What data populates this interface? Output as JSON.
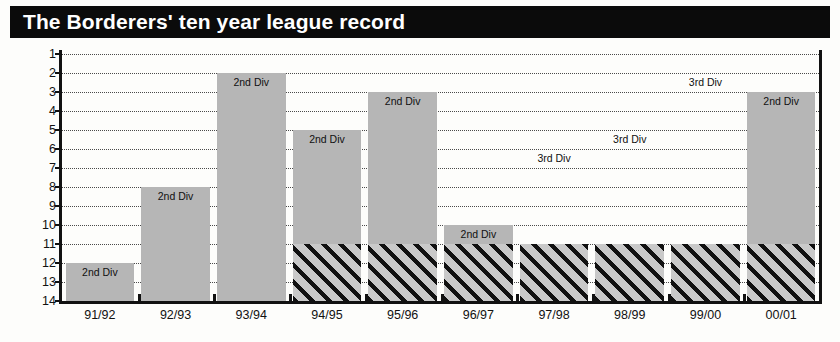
{
  "title": "The Borderers' ten year league record",
  "chart_data": {
    "type": "bar",
    "title": "The Borderers' ten year league record",
    "xlabel": "",
    "ylabel": "",
    "orientation": "vertical-inverted",
    "note": "Y axis is league position: 1 at top, 14 at bottom. Bars hang down from the finishing position to the bottom of the chart. Solid grey segments = 2nd Division seasons; diagonally hatched segments = 3rd Division seasons.",
    "categories": [
      "91/92",
      "92/93",
      "93/94",
      "94/95",
      "95/96",
      "96/97",
      "97/98",
      "98/99",
      "99/00",
      "00/01"
    ],
    "values": [
      12,
      8,
      2,
      5,
      3,
      10,
      11,
      11,
      11,
      3
    ],
    "ylim": [
      1,
      14
    ],
    "y_ticks": [
      1,
      2,
      3,
      4,
      5,
      6,
      7,
      8,
      9,
      10,
      11,
      12,
      13,
      14
    ],
    "grid": true,
    "legend": "none",
    "division_labels": [
      "2nd Div",
      "2nd Div",
      "2nd Div",
      "2nd Div",
      "2nd Div",
      "2nd Div",
      "3rd Div",
      "3rd Div",
      "3rd Div",
      "2nd Div"
    ],
    "bars": [
      {
        "season": "91/92",
        "position": 12,
        "division": "2nd Div",
        "label": "2nd Div",
        "label_position": 12,
        "solid_top": 12,
        "solid_bottom": 14,
        "hatch_top": null,
        "hatch_bottom": null
      },
      {
        "season": "92/93",
        "position": 8,
        "division": "2nd Div",
        "label": "2nd Div",
        "label_position": 8,
        "solid_top": 8,
        "solid_bottom": 14,
        "hatch_top": null,
        "hatch_bottom": null
      },
      {
        "season": "93/94",
        "position": 2,
        "division": "2nd Div",
        "label": "2nd Div",
        "label_position": 2,
        "solid_top": 2,
        "solid_bottom": 14,
        "hatch_top": null,
        "hatch_bottom": null
      },
      {
        "season": "94/95",
        "position": 5,
        "division": "2nd Div",
        "label": "2nd Div",
        "label_position": 5,
        "solid_top": 5,
        "solid_bottom": 11,
        "hatch_top": 11,
        "hatch_bottom": 14
      },
      {
        "season": "95/96",
        "position": 3,
        "division": "2nd Div",
        "label": "2nd Div",
        "label_position": 3,
        "solid_top": 3,
        "solid_bottom": 11,
        "hatch_top": 11,
        "hatch_bottom": 14
      },
      {
        "season": "96/97",
        "position": 10,
        "division": "2nd Div",
        "label": "2nd Div",
        "label_position": 10,
        "solid_top": 10,
        "solid_bottom": 11,
        "hatch_top": 11,
        "hatch_bottom": 14
      },
      {
        "season": "97/98",
        "position": 11,
        "division": "3rd Div",
        "label": "3rd Div",
        "label_position": 6,
        "solid_top": null,
        "solid_bottom": null,
        "hatch_top": 11,
        "hatch_bottom": 14
      },
      {
        "season": "98/99",
        "position": 11,
        "division": "3rd Div",
        "label": "3rd Div",
        "label_position": 5,
        "solid_top": null,
        "solid_bottom": null,
        "hatch_top": 11,
        "hatch_bottom": 14
      },
      {
        "season": "99/00",
        "position": 11,
        "division": "3rd Div",
        "label": "3rd Div",
        "label_position": 2,
        "solid_top": null,
        "solid_bottom": null,
        "hatch_top": 11,
        "hatch_bottom": 14
      },
      {
        "season": "00/01",
        "position": 3,
        "division": "2nd Div",
        "label": "2nd Div",
        "label_position": 3,
        "solid_top": 3,
        "solid_bottom": 11,
        "hatch_top": 11,
        "hatch_bottom": 14
      }
    ],
    "colors": {
      "title_bar_background": "#0b0b0b",
      "title_text": "#ffffff",
      "solid_bar": "#b6b6b6",
      "hatch_bar_base": "#c9c9c9",
      "hatch_stripe": "#111111",
      "axis": "#111111",
      "gridline": "#4a4a4a",
      "plot_background": "#fdfdfb"
    }
  }
}
